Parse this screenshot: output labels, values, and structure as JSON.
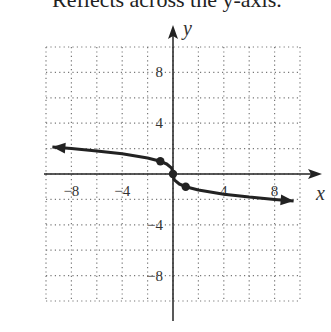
{
  "caption": "Reflects across the y-axis.",
  "chart_data": {
    "type": "line",
    "title": "",
    "xlabel": "x",
    "ylabel": "y",
    "xlim": [
      -10,
      10
    ],
    "ylim": [
      -10,
      10
    ],
    "grid": true,
    "grid_step": 2,
    "x_ticks": [
      -8,
      -4,
      4,
      8
    ],
    "y_ticks": [
      8,
      4,
      -4,
      -8
    ],
    "x_tick_labels": [
      "-8",
      "-4",
      "4",
      "8"
    ],
    "y_tick_labels": [
      "8",
      "4",
      "-4",
      "-8"
    ],
    "series": [
      {
        "name": "y = -cbrt(x)",
        "points": [
          [
            -9.5,
            2.12
          ],
          [
            -8,
            2
          ],
          [
            -6,
            1.82
          ],
          [
            -4,
            1.59
          ],
          [
            -2,
            1.26
          ],
          [
            -1,
            1
          ],
          [
            -0.5,
            0.79
          ],
          [
            -0.1,
            0.46
          ],
          [
            0,
            0
          ],
          [
            0.1,
            -0.46
          ],
          [
            0.5,
            -0.79
          ],
          [
            1,
            -1
          ],
          [
            2,
            -1.26
          ],
          [
            4,
            -1.59
          ],
          [
            6,
            -1.82
          ],
          [
            8,
            -2
          ],
          [
            9.5,
            -2.12
          ]
        ],
        "arrows": [
          "start",
          "end"
        ]
      }
    ],
    "marked_points": [
      [
        -1,
        1
      ],
      [
        0,
        0
      ],
      [
        1,
        -1
      ]
    ]
  }
}
